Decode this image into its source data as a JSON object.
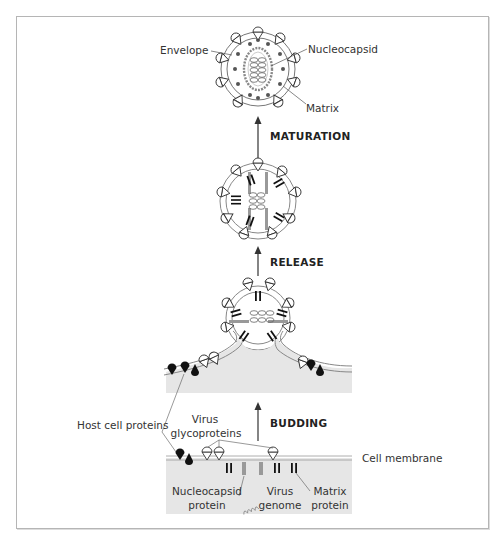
{
  "figure": {
    "type": "diagram"
  },
  "stages": {
    "budding": "BUDDING",
    "release": "RELEASE",
    "maturation": "MATURATION"
  },
  "labels": {
    "envelope": "Envelope",
    "nucleocapsid": "Nucleocapsid",
    "matrix": "Matrix",
    "host_cell_proteins": "Host cell proteins",
    "virus_glycoproteins_line1": "Virus",
    "virus_glycoproteins_line2": "glycoproteins",
    "cell_membrane": "Cell membrane",
    "nucleocapsid_protein_line1": "Nucleocapsid",
    "nucleocapsid_protein_line2": "protein",
    "virus_genome_line1": "Virus",
    "virus_genome_line2": "genome",
    "matrix_protein_line1": "Matrix",
    "matrix_protein_line2": "protein"
  },
  "colors": {
    "frame": "#b5b5b5",
    "cytoplasm": "#e6e6e6",
    "line": "#555555",
    "nucleocapsid_protein": "#999999",
    "dark": "#111111"
  }
}
